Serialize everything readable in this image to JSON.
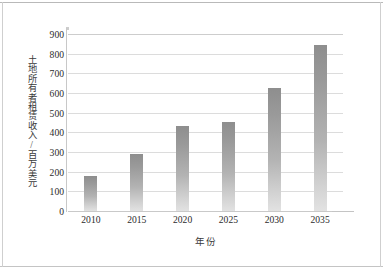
{
  "chart_data": {
    "type": "bar",
    "title": "",
    "xlabel": "年份",
    "ylabel": "土地所有者租赁收入/百万美元",
    "categories": [
      "2010",
      "2015",
      "2020",
      "2025",
      "2030",
      "2035"
    ],
    "values": [
      180,
      288,
      430,
      455,
      623,
      843
    ],
    "series": [
      {
        "name": "土地所有者租赁收入",
        "values": [
          180,
          288,
          430,
          455,
          623,
          843
        ]
      }
    ],
    "ylim": [
      0,
      900
    ],
    "ytick_step": 100,
    "yticks": [
      "900",
      "800",
      "700",
      "600",
      "500",
      "400",
      "300",
      "200",
      "100",
      "0"
    ],
    "ytick_values": [
      900,
      800,
      700,
      600,
      500,
      400,
      300,
      200,
      100,
      0
    ],
    "grid": true,
    "grid_axis": "y",
    "legend": false,
    "legend_position": "none",
    "bar_color": "#9a9a9a",
    "bar_color_top": "#8e8e8e",
    "bar_color_bottom": "#e2e2e2",
    "gridline_color": "#dcdcdc",
    "axis_color": "#c8c8c8",
    "text_color": "#2c2c2c",
    "background": "#ffffff"
  }
}
